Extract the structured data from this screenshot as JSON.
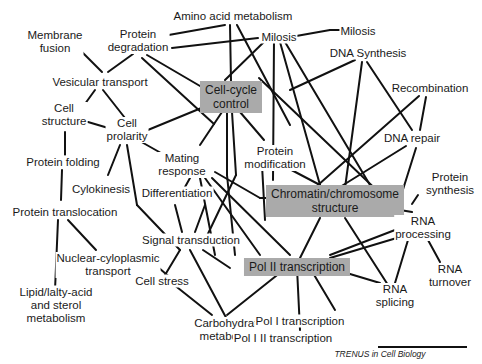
{
  "diagram": {
    "hubs": {
      "cell_cycle": "Cell-cycle\ncontrol",
      "chromatin": "Chromatin/chromosome\nstructure",
      "pol2": "Pol II transcription"
    },
    "nodes": {
      "membrane_fusion": "Membrane\nfusion",
      "protein_degradation": "Protein\ndegradation",
      "amino_acid": "Amino acid metabolism",
      "milosis_center": "Milosis",
      "milosis_right": "Milosis",
      "dna_synthesis": "DNA Synthesis",
      "vesicular_transport": "Vesicular transport",
      "cell_structure": "Cell\nstructure",
      "cell_prolarity": "Cell\nprolarity",
      "recombination": "Recombination",
      "mating_response": "Mating\nresponse",
      "protein_modification": "Protein\nmodification",
      "dna_repair": "DNA repair",
      "protein_folding": "Protein folding",
      "cylokinesis": "Cylokinesis",
      "differentiation": "Differentiation",
      "protein_synthesis": "Protein\nsynthesis",
      "protein_translocation": "Protein translocation",
      "rna_processing": "RNA\nprocessing",
      "signal_transduction": "Signal transduction",
      "nuclear_cytoplasmic": "Nuclear-cyloplasmic\ntransport",
      "cell_stress": "Cell stress",
      "lipid": "Lipid/lalty-acid\nand sterol\nmetabolism",
      "rna_turnover": "RNA\nturnover",
      "rna_splicing": "RNA\nsplicing",
      "carbohydrate": "Carbohydrate\nmetabolism",
      "pol1": "Pol I transcription",
      "pol1_2": "Pol I II transcription"
    },
    "credit": "TRENUS in Cell Biology",
    "colors": {
      "hub_fill": "#aaaaaa",
      "edge": "#111111",
      "background": "#ffffff"
    }
  }
}
